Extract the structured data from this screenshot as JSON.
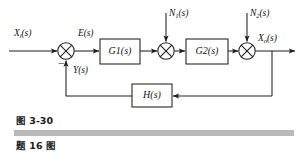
{
  "figure": {
    "type": "control-system-block-diagram",
    "line_color": "#1f1f1f",
    "text_color": "#121212",
    "background": "#ffffff",
    "signals": {
      "input_label": "X",
      "input_sub": "i",
      "input_suffix": "(s)",
      "error_label": "E",
      "error_suffix": "(s)",
      "feedback_label": "Y",
      "feedback_suffix": "(s)",
      "disturbance1_label": "N",
      "disturbance1_sub": "1",
      "disturbance1_suffix": "(s)",
      "disturbance2_label": "N",
      "disturbance2_sub": "2",
      "disturbance2_suffix": "(s)",
      "output_label": "X",
      "output_sub": "o",
      "output_suffix": "(s)"
    },
    "blocks": {
      "g1_label": "G",
      "g1_sub": "1",
      "g1_suffix": "(s)",
      "g2_label": "G",
      "g2_sub": "2",
      "g2_suffix": "(s)",
      "h_label": "H(s)"
    },
    "sign_marks": {
      "summing1_negative": "−"
    }
  },
  "caption": {
    "figure_number": "图 3-30",
    "problem_title": "题 16 图",
    "rule_color": "#b9b9b9"
  }
}
